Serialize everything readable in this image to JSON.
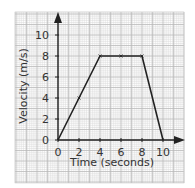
{
  "chart_data": {
    "type": "line",
    "title": "",
    "xlabel": "Time (seconds)",
    "ylabel": "Velocity (m/s)",
    "x_ticks": [
      0,
      2,
      4,
      6,
      8,
      10
    ],
    "y_ticks": [
      0,
      2,
      4,
      6,
      8,
      10
    ],
    "xlim": [
      0,
      12
    ],
    "ylim": [
      0,
      11
    ],
    "grid": true,
    "series": [
      {
        "name": "velocity",
        "x": [
          0,
          2,
          4,
          6,
          8,
          10
        ],
        "y": [
          0,
          4,
          8,
          8,
          8,
          0
        ]
      }
    ],
    "marked_points": [
      [
        2,
        4
      ],
      [
        4,
        8
      ],
      [
        6,
        8
      ],
      [
        8,
        8
      ]
    ]
  }
}
